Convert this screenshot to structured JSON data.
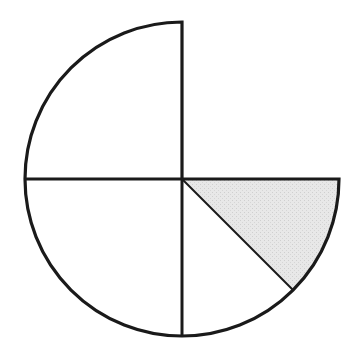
{
  "diagram": {
    "type": "circle-fraction",
    "center": [
      182,
      179
    ],
    "radius": 157,
    "parts": [
      {
        "name": "top-left-quarter",
        "fraction": "1/4",
        "shaded": false
      },
      {
        "name": "bottom-left-quarter",
        "fraction": "1/4",
        "shaded": false
      },
      {
        "name": "bottom-right-lower-eighth",
        "fraction": "1/8",
        "shaded": false
      },
      {
        "name": "bottom-right-upper-eighth",
        "fraction": "1/8",
        "shaded": true
      }
    ],
    "missing_part": {
      "name": "top-right-quarter",
      "fraction": "1/4"
    },
    "colors": {
      "stroke": "#1a1a1a",
      "shade": "#e4e4e4",
      "background": "#ffffff"
    }
  }
}
